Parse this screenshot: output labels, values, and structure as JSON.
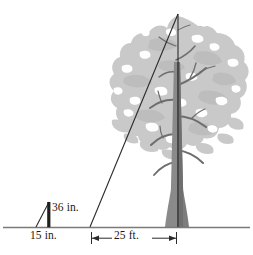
{
  "figure": {
    "type": "geometry-diagram",
    "labels": {
      "stake_height": "36 in.",
      "stake_distance": "15 in.",
      "tree_distance": "25 ft."
    },
    "colors": {
      "line": "#2b2b2b",
      "ground": "#6e6e6e",
      "canopy": "#c9c9c9",
      "canopy_shadow": "#b5b5b5",
      "trunk": "#8a8a8a",
      "trunk_dark": "#6b6b6b",
      "background": "#ffffff",
      "text": "#1a1a1a"
    },
    "geometry": {
      "ground_y": 227,
      "observer_x": 90,
      "stake_base_x": 36,
      "stake_top_x": 49,
      "stake_top_y": 202,
      "tree_base_x": 176,
      "tree_apex_x": 178,
      "tree_apex_y": 14,
      "dim_arrow_left_x": 92,
      "dim_arrow_right_x": 176,
      "dim_arrow_y": 238
    }
  }
}
